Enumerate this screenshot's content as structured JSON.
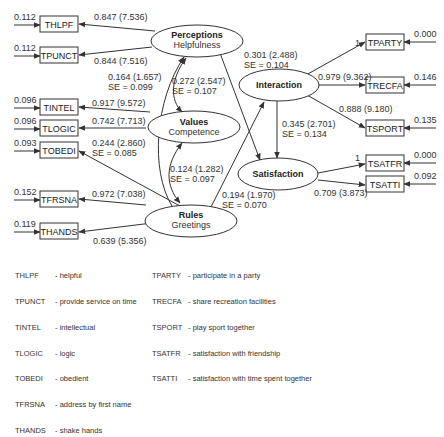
{
  "latent_variables": {
    "perceptions": {
      "title": "Perceptions",
      "subtitle": "Helpfulness"
    },
    "values": {
      "title": "Values",
      "subtitle": "Competence"
    },
    "rules": {
      "title": "Rules",
      "subtitle": "Greetings"
    },
    "interaction": {
      "title": "Interaction"
    },
    "satisfaction": {
      "title": "Satisfaction"
    }
  },
  "indicators": {
    "thlpf": {
      "name": "THLPF",
      "error": "0.112",
      "loading": "0.847 (7.536)"
    },
    "tpunct": {
      "name": "TPUNCT",
      "error": "0.112",
      "loading": "0.844 (7.516)"
    },
    "tintel": {
      "name": "TINTEL",
      "error": "0.096",
      "loading": "0.917 (9.572)"
    },
    "tlogic": {
      "name": "TLOGIC",
      "error": "0.096",
      "loading": "0.742 (7.713)"
    },
    "tobedi": {
      "name": "TOBEDI",
      "error": "0.093",
      "loading": "0.244 (2.860)",
      "se": "SE = 0.085"
    },
    "tfrsna": {
      "name": "TFRSNA",
      "error": "0.152",
      "loading": "0.972 (7.038)"
    },
    "thands": {
      "name": "THANDS",
      "error": "0.119",
      "loading": "0.639 (5.356)"
    },
    "tparty": {
      "name": "TPARTY",
      "error": "0.000",
      "loading": "1"
    },
    "trecfa": {
      "name": "TRECFA",
      "error": "0.146",
      "loading": "0.979 (9.362)"
    },
    "tsport": {
      "name": "TSPORT",
      "error": "0.135",
      "loading": "0.888 (9.180)"
    },
    "tsatfr": {
      "name": "TSATFR",
      "error": "0.000",
      "loading": "1"
    },
    "tsatti": {
      "name": "TSATTI",
      "error": "0.092",
      "loading": "0.709 (3.873)"
    }
  },
  "paths": {
    "perceptions_values_cov": {
      "coef": "0.164 (1.657)",
      "se": "SE = 0.099"
    },
    "perceptions_values_cov2": {
      "coef": "0.272 (2.547)",
      "se": "SE = 0.107"
    },
    "values_rules_cov": {
      "coef": "0.124 (1.282)",
      "se": "SE = 0.097"
    },
    "perceptions_satisfaction": {
      "coef": "0.301 (2.488)",
      "se": "SE = 0.104"
    },
    "interaction_satisfaction": {
      "coef": "0.345 (2.701)",
      "se": "SE = 0.134"
    },
    "rules_interaction": {
      "coef": "0.194 (1.970)",
      "se": "SE = 0.070"
    }
  },
  "legend": {
    "left": [
      {
        "code": "THLPF",
        "desc": "- helpful"
      },
      {
        "code": "TPUNCT",
        "desc": "- provide service on time"
      },
      {
        "code": "TINTEL",
        "desc": "- intellectual"
      },
      {
        "code": "TLOGIC",
        "desc": "- logic"
      },
      {
        "code": "TOBEDI",
        "desc": "- obedient"
      },
      {
        "code": "TFRSNA",
        "desc": "- address by first name"
      },
      {
        "code": "THANDS",
        "desc": "- shake hands"
      }
    ],
    "right": [
      {
        "code": "TPARTY",
        "desc": "- participate in a party"
      },
      {
        "code": "TRECFA",
        "desc": "- share recreation facilities"
      },
      {
        "code": "TSPORT",
        "desc": "- play sport together"
      },
      {
        "code": "TSATFR",
        "desc": "- satisfaction with friendship"
      },
      {
        "code": "TSATTI",
        "desc": "- satisfaction with time spent together"
      }
    ]
  }
}
